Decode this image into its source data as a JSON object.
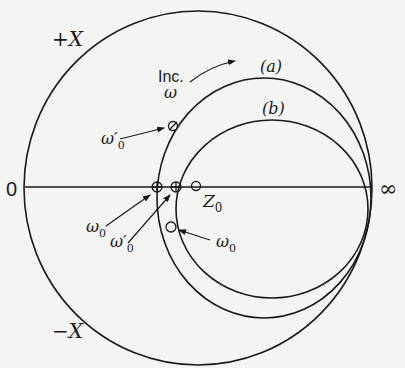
{
  "diagram": {
    "type": "impedance-locus",
    "colors": {
      "ink": "#1a1a1a",
      "paper": "#f4f4f2"
    },
    "labels": {
      "plus_x": "+X",
      "minus_x": "−X",
      "zero": "0",
      "infinity": "∞",
      "inc": "Inc.",
      "omega": "ω",
      "curve_a": "(a)",
      "curve_b": "(b)",
      "z0_main": "Z",
      "z0_sub": "0",
      "omega0_prime_top_main": "ω′",
      "omega0_prime_top_sub": "0",
      "omega0_left_main": "ω",
      "omega0_left_sub": "0",
      "omega0_prime_bottom_main": "ω′",
      "omega0_prime_bottom_sub": "0",
      "omega0_right_main": "ω",
      "omega0_right_sub": "0"
    },
    "curves": [
      {
        "name": "outer-circle",
        "label": ""
      },
      {
        "name": "curve-a",
        "label": "(a)"
      },
      {
        "name": "curve-b",
        "label": "(b)"
      }
    ],
    "points": [
      {
        "name": "omega0-prime-on-a-top",
        "marker": "circle"
      },
      {
        "name": "omega0-on-a-axis",
        "marker": "crossed-circle"
      },
      {
        "name": "omega0-prime-on-b-axis",
        "marker": "crossed-circle"
      },
      {
        "name": "z0-point",
        "marker": "circle"
      },
      {
        "name": "omega0-on-b-lower",
        "marker": "circle"
      }
    ]
  }
}
